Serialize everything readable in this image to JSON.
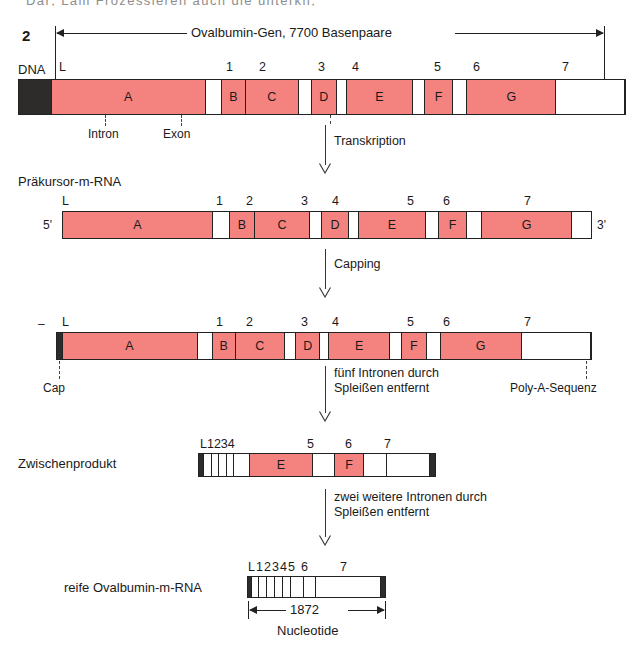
{
  "page": {
    "cutoff_header_text": "Dar; Lam Frozessieren auch die  ünterkn;",
    "figure_number": "2"
  },
  "scale_bar": {
    "label": "Ovalbumin-Gen, 7700 Basenpaare"
  },
  "rows": [
    {
      "id": "dna",
      "label": "DNA",
      "segment_numbers": [
        "L",
        "1",
        "2",
        "3",
        "4",
        "5",
        "6",
        "7"
      ],
      "segments": [
        {
          "kind": "black",
          "text": ""
        },
        {
          "kind": "exon",
          "text": "A"
        },
        {
          "kind": "intron",
          "text": ""
        },
        {
          "kind": "exon",
          "text": "B"
        },
        {
          "kind": "exon",
          "text": "C"
        },
        {
          "kind": "intron",
          "text": ""
        },
        {
          "kind": "exon",
          "text": "D"
        },
        {
          "kind": "intron",
          "text": ""
        },
        {
          "kind": "exon",
          "text": "E"
        },
        {
          "kind": "intron",
          "text": ""
        },
        {
          "kind": "exon",
          "text": "F"
        },
        {
          "kind": "intron",
          "text": ""
        },
        {
          "kind": "exon",
          "text": "G"
        },
        {
          "kind": "intron",
          "text": ""
        },
        {
          "kind": "black",
          "text": ""
        }
      ],
      "annotations": {
        "intron_label": "Intron",
        "exon_label": "Exon"
      }
    },
    {
      "id": "precursor",
      "label": "Präkursor-m-RNA",
      "five_prime": "5'",
      "three_prime": "3'",
      "segment_numbers": [
        "L",
        "1",
        "2",
        "3",
        "4",
        "5",
        "6",
        "7"
      ]
    },
    {
      "id": "capped",
      "label": "",
      "left_dash": "–",
      "cap_label": "Cap",
      "polyA_label": "Poly-A-Sequenz",
      "segment_numbers": [
        "L",
        "1",
        "2",
        "3",
        "4",
        "5",
        "6",
        "7"
      ]
    },
    {
      "id": "intermediate",
      "label": "Zwischenprodukt",
      "segment_numbers": [
        "L1234",
        "5",
        "6",
        "7"
      ],
      "segments": [
        {
          "kind": "black",
          "text": ""
        },
        {
          "kind": "intron",
          "text": ""
        },
        {
          "kind": "intron",
          "text": ""
        },
        {
          "kind": "intron",
          "text": ""
        },
        {
          "kind": "intron",
          "text": ""
        },
        {
          "kind": "intron",
          "text": ""
        },
        {
          "kind": "exon",
          "text": "E"
        },
        {
          "kind": "intron",
          "text": ""
        },
        {
          "kind": "exon",
          "text": "F"
        },
        {
          "kind": "intron",
          "text": ""
        },
        {
          "kind": "intron",
          "text": ""
        },
        {
          "kind": "black",
          "text": ""
        }
      ]
    },
    {
      "id": "mature",
      "label": "reife Ovalbumin-m-RNA",
      "segment_numbers": [
        "L",
        "1",
        "2",
        "3",
        "4",
        "5",
        "6",
        "7"
      ],
      "size_label": "1872",
      "size_unit": "Nucleotide"
    }
  ],
  "processes": [
    {
      "id": "transkription",
      "lines": [
        "Transkription"
      ]
    },
    {
      "id": "capping",
      "lines": [
        "Capping"
      ]
    },
    {
      "id": "splice-five",
      "lines": [
        "fünf Intronen durch",
        "Spleißen entfernt"
      ]
    },
    {
      "id": "splice-two",
      "lines": [
        "zwei weitere Intronen durch",
        "Spleißen entfernt"
      ]
    }
  ],
  "colors": {
    "exon": "#f4827f",
    "intron": "#ffffff",
    "terminal": "#2e2b2b",
    "outline": "#222222",
    "text": "#1a1a1a"
  }
}
